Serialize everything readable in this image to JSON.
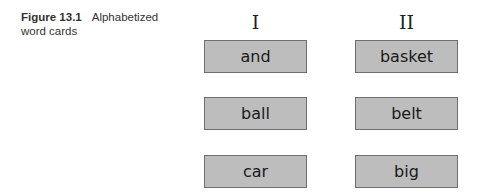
{
  "caption": {
    "figure_label": "Figure 13.1",
    "title": "Alphabetized word cards"
  },
  "columns": [
    {
      "header": "I",
      "cards": [
        "and",
        "ball",
        "car"
      ]
    },
    {
      "header": "II",
      "cards": [
        "basket",
        "belt",
        "big"
      ]
    }
  ],
  "colors": {
    "card_fill": "#bdbdbd",
    "card_border": "#6e6e6e",
    "text": "#1a1a1a"
  }
}
